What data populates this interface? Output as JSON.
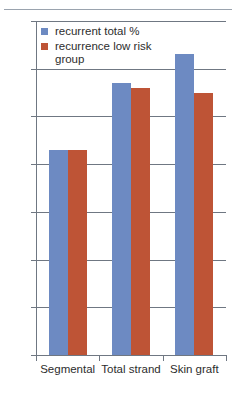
{
  "chart_data": {
    "type": "bar",
    "title": "",
    "subtitle": "",
    "xlabel": "",
    "ylabel": "",
    "categories": [
      "Segmental",
      "Total strand",
      "Skin graft"
    ],
    "series": [
      {
        "name": "recurrent total %",
        "color": "#6d8ac2",
        "values": [
          43,
          57,
          63
        ]
      },
      {
        "name": "recurrence low risk group",
        "color": "#be5436",
        "values": [
          43,
          56,
          55
        ]
      }
    ],
    "ylim": [
      0,
      70
    ],
    "ytick_values": [
      0,
      10,
      20,
      30,
      40,
      50,
      60,
      70
    ],
    "ytick_labels": [
      "0",
      "10",
      "20",
      "30",
      "40",
      "50",
      "60",
      "70"
    ],
    "grid": true,
    "grid_axis": "y",
    "legend_position": "top-left",
    "annotations": []
  }
}
